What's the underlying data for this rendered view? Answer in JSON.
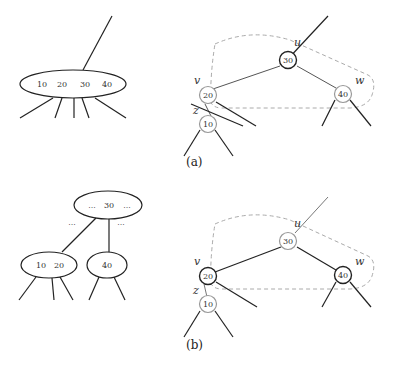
{
  "panels": [
    {
      "caption": "(a)",
      "btree": {
        "node_keys": [
          "10",
          "20",
          "30",
          "40"
        ]
      },
      "rbtree": {
        "nodes": [
          {
            "id": "u",
            "key": "30",
            "label": "u",
            "color": "black"
          },
          {
            "id": "v",
            "key": "20",
            "label": "v",
            "color": "red"
          },
          {
            "id": "w",
            "key": "40",
            "label": "w",
            "color": "red"
          },
          {
            "id": "z",
            "key": "10",
            "label": "z",
            "color": "red"
          }
        ]
      }
    },
    {
      "caption": "(b)",
      "btree": {
        "parent_keys": [
          "...",
          "30",
          "..."
        ],
        "parent_gap_labels": [
          "...",
          "..."
        ],
        "left_child_keys": [
          "10",
          "20"
        ],
        "right_child_keys": [
          "40"
        ]
      },
      "rbtree": {
        "nodes": [
          {
            "id": "u",
            "key": "30",
            "label": "u",
            "color": "red"
          },
          {
            "id": "v",
            "key": "20",
            "label": "v",
            "color": "black"
          },
          {
            "id": "w",
            "key": "40",
            "label": "w",
            "color": "black"
          },
          {
            "id": "z",
            "key": "10",
            "label": "z",
            "color": "red"
          }
        ]
      }
    }
  ],
  "colors": {
    "black_node_stroke": "#222222",
    "red_node_stroke": "#999999",
    "dashed_outline": "#aaaaaa"
  }
}
